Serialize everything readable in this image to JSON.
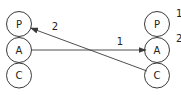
{
  "diagram": {
    "left_stack": {
      "nodes": [
        {
          "id": "left-P",
          "label": "P",
          "cx": 19,
          "cy": 24
        },
        {
          "id": "left-A",
          "label": "A",
          "cx": 19,
          "cy": 50
        },
        {
          "id": "left-C",
          "label": "C",
          "cx": 19,
          "cy": 75
        }
      ]
    },
    "right_stack": {
      "nodes": [
        {
          "id": "right-P",
          "label": "P",
          "cx": 157,
          "cy": 24
        },
        {
          "id": "right-A",
          "label": "A",
          "cx": 157,
          "cy": 50
        },
        {
          "id": "right-C",
          "label": "C",
          "cx": 157,
          "cy": 75
        }
      ]
    },
    "node_radius": 12.5,
    "edges": [
      {
        "id": "edge-1",
        "label": "1",
        "from": "left-A",
        "to": "right-A"
      },
      {
        "id": "edge-2",
        "label": "2",
        "from": "right-C",
        "to": "left-P"
      }
    ],
    "side_labels": [
      "1",
      "2"
    ],
    "colors": {
      "stroke": "#3a3a3a",
      "text": "#222222",
      "background": "#ffffff"
    }
  }
}
